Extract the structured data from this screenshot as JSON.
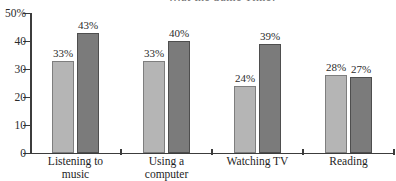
{
  "chart_data": {
    "type": "bar",
    "title_fragment": "…at the Same Time?",
    "categories": [
      "Listening to music",
      "Using a computer",
      "Watching TV",
      "Reading"
    ],
    "category_label_lines": [
      [
        "Listening to",
        "music"
      ],
      [
        "Using a",
        "computer"
      ],
      [
        "Watching TV"
      ],
      [
        "Reading"
      ]
    ],
    "series": [
      {
        "name": "series-1-light",
        "color": "#b5b5b5",
        "border_color": "#7e7e7e",
        "values": [
          33,
          33,
          24,
          28
        ],
        "labels": [
          "33%",
          "33%",
          "24%",
          "28%"
        ]
      },
      {
        "name": "series-2-dark",
        "color": "#7b7b7b",
        "border_color": "#4e4e4e",
        "values": [
          43,
          40,
          39,
          27
        ],
        "labels": [
          "43%",
          "40%",
          "39%",
          "27%"
        ]
      }
    ],
    "y_axis": {
      "tick_labels": [
        "50%",
        "40",
        "30",
        "20",
        "10",
        "0"
      ],
      "tick_values": [
        50,
        40,
        30,
        20,
        10,
        0
      ],
      "range": [
        0,
        50
      ]
    },
    "value_label_suffix": "%",
    "legend": "none",
    "grid": false,
    "axis_color": "#3c3c3c",
    "text_color": "#2b2b2b",
    "background_color": "#ffffff"
  }
}
